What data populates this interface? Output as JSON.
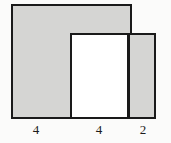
{
  "figure": {
    "type": "geometry-composite-rectangles",
    "background_color": "#fbfbfa",
    "stroke_color": "#1a1a1a",
    "shapes": [
      {
        "name": "large-gray-rectangle",
        "fill": "#d5d5d3",
        "base_label": "4"
      },
      {
        "name": "middle-white-rectangle",
        "fill": "#ffffff",
        "base_label": "4"
      },
      {
        "name": "right-gray-rectangle",
        "fill": "#d5d5d3",
        "base_label": "2"
      }
    ],
    "labels": {
      "left": "4",
      "center": "4",
      "right": "2"
    }
  }
}
